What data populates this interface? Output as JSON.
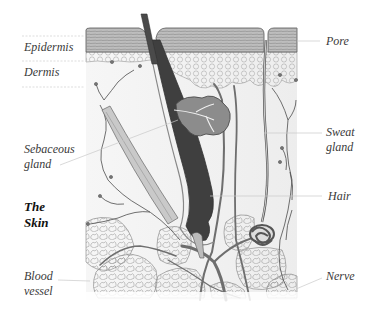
{
  "diagram": {
    "title": "The Skin",
    "title_lines": [
      "The",
      "Skin"
    ],
    "labels": {
      "epidermis": "Epidermis",
      "dermis": "Dermis",
      "pore": "Pore",
      "sebaceous_gland": [
        "Sebaceous",
        "gland"
      ],
      "sweat_gland": [
        "Sweat",
        "gland"
      ],
      "hair": "Hair",
      "blood_vessel": [
        "Blood",
        "vessel"
      ],
      "nerve": "Nerve"
    },
    "colors": {
      "background": "#ffffff",
      "epidermis_fill": "#b9b9b9",
      "hair_shaft": "#555555",
      "gland_fill": "#8c8c8c",
      "vessel": "#6e6e6e",
      "line": "#444444",
      "leader_line": "#c8c8c8",
      "label_text": "#3a3a3a"
    }
  }
}
